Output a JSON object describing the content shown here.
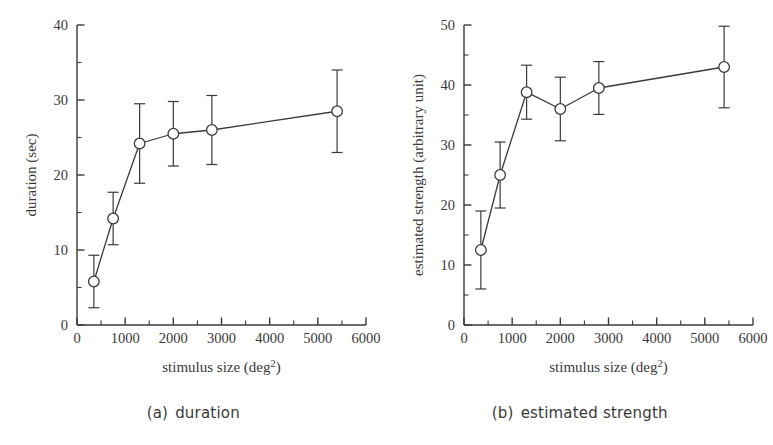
{
  "figure": {
    "background": "#ffffff",
    "ink": "#3a3a3a"
  },
  "panels": [
    {
      "id": "panel-a",
      "caption_tag": "(a)",
      "caption_text": "duration",
      "xlabel_main": "stimulus size (deg",
      "xlabel_sup": "2",
      "xlabel_tail": ")",
      "ylabel": "duration (sec)"
    },
    {
      "id": "panel-b",
      "caption_tag": "(b)",
      "caption_text": "estimated strength",
      "xlabel_main": "stimulus size (deg",
      "xlabel_sup": "2",
      "xlabel_tail": ")",
      "ylabel": "estimated strength (arbitrary unit)"
    }
  ],
  "chart_data": [
    {
      "type": "line",
      "id": "duration",
      "title": "(a) duration",
      "xlabel": "stimulus size (deg2)",
      "ylabel": "duration (sec)",
      "xlim": [
        0,
        6000
      ],
      "ylim": [
        0,
        40
      ],
      "xticks": [
        0,
        1000,
        2000,
        3000,
        4000,
        5000,
        6000
      ],
      "xticklabels": [
        "0",
        "1000",
        "2000",
        "3000",
        "4000",
        "5000",
        "6000"
      ],
      "xminor_step": 500,
      "yticks": [
        0,
        10,
        20,
        30,
        40
      ],
      "yticklabels": [
        "0",
        "10",
        "20",
        "30",
        "40"
      ],
      "yminor_step": 5,
      "grid": false,
      "legend": "none",
      "marker": "open-circle",
      "errorbars": true,
      "x": [
        350,
        750,
        1300,
        2000,
        2800,
        5400
      ],
      "values": [
        5.8,
        14.2,
        24.2,
        25.5,
        26.0,
        28.5
      ],
      "yerr": [
        3.5,
        3.5,
        5.3,
        4.3,
        4.6,
        5.5
      ]
    },
    {
      "type": "line",
      "id": "estimated-strength",
      "title": "(b) estimated strength",
      "xlabel": "stimulus size (deg2)",
      "ylabel": "estimated strength (arbitrary unit)",
      "xlim": [
        0,
        6000
      ],
      "ylim": [
        0,
        50
      ],
      "xticks": [
        0,
        1000,
        2000,
        3000,
        4000,
        5000,
        6000
      ],
      "xticklabels": [
        "0",
        "1000",
        "2000",
        "3000",
        "4000",
        "5000",
        "6000"
      ],
      "xminor_step": 500,
      "yticks": [
        0,
        10,
        20,
        30,
        40,
        50
      ],
      "yticklabels": [
        "0",
        "10",
        "20",
        "30",
        "40",
        "50"
      ],
      "yminor_step": 5,
      "grid": false,
      "legend": "none",
      "marker": "open-circle",
      "errorbars": true,
      "x": [
        350,
        750,
        1300,
        2000,
        2800,
        5400
      ],
      "values": [
        12.5,
        25.0,
        38.8,
        36.0,
        39.5,
        43.0
      ],
      "yerr": [
        6.5,
        5.5,
        4.5,
        5.3,
        4.4,
        6.8
      ]
    }
  ]
}
